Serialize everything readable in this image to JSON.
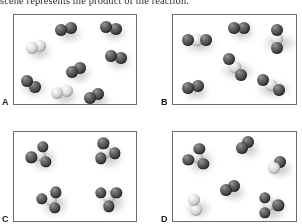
{
  "question": {
    "stem_text": "scene represents the product of the reaction."
  },
  "figure": {
    "type": "molecular-scene-multiple-choice",
    "panel_count": 4,
    "style": "space-filling-model-grayscale",
    "colors": {
      "dark_atom": "#4a4a4a",
      "light_atom": "#dcdcdc",
      "panel_border": "#6d6d6d",
      "panel_background": "#fdfdfd",
      "page_background": "#ffffff",
      "text": "#2e2e2e"
    },
    "panels": [
      {
        "id": "a",
        "label": "A",
        "description": "eight diatomic molecules: six dark-dark pairs and two light-light pairs",
        "molecules": [
          {
            "kind": "diatomic",
            "atoms": [
              "dark",
              "dark"
            ],
            "x": 52,
            "y": 14,
            "angle": -12,
            "scale": 1.0
          },
          {
            "kind": "diatomic",
            "atoms": [
              "dark",
              "dark"
            ],
            "x": 97,
            "y": 13,
            "angle": 8,
            "scale": 1.0
          },
          {
            "kind": "diatomic",
            "atoms": [
              "light",
              "light"
            ],
            "x": 22,
            "y": 32,
            "angle": -18,
            "scale": 1.0
          },
          {
            "kind": "diatomic",
            "atoms": [
              "dark",
              "dark"
            ],
            "x": 102,
            "y": 42,
            "angle": 16,
            "scale": 1.0
          },
          {
            "kind": "diatomic",
            "atoms": [
              "dark",
              "dark"
            ],
            "x": 62,
            "y": 55,
            "angle": -28,
            "scale": 1.0
          },
          {
            "kind": "diatomic",
            "atoms": [
              "dark",
              "dark"
            ],
            "x": 17,
            "y": 69,
            "angle": 35,
            "scale": 1.0
          },
          {
            "kind": "diatomic",
            "atoms": [
              "light",
              "light"
            ],
            "x": 48,
            "y": 77,
            "angle": -8,
            "scale": 1.0
          },
          {
            "kind": "diatomic",
            "atoms": [
              "dark",
              "dark"
            ],
            "x": 80,
            "y": 81,
            "angle": -20,
            "scale": 1.0
          }
        ]
      },
      {
        "id": "b",
        "label": "B",
        "description": "three dark-light-dark triatomic molecules plus three lone dark diatomic molecules",
        "molecules": [
          {
            "kind": "triatomic",
            "atoms": [
              "dark",
              "light",
              "dark"
            ],
            "x": 24,
            "y": 25,
            "angle": 0,
            "scale": 1.0
          },
          {
            "kind": "diatomic",
            "atoms": [
              "dark",
              "dark"
            ],
            "x": 66,
            "y": 13,
            "angle": -6,
            "scale": 1.0
          },
          {
            "kind": "triatomic",
            "atoms": [
              "dark",
              "light",
              "dark"
            ],
            "x": 104,
            "y": 24,
            "angle": 88,
            "scale": 1.0
          },
          {
            "kind": "triatomic",
            "atoms": [
              "dark",
              "light",
              "dark"
            ],
            "x": 62,
            "y": 52,
            "angle": 54,
            "scale": 1.0
          },
          {
            "kind": "diatomic",
            "atoms": [
              "dark",
              "dark"
            ],
            "x": 20,
            "y": 72,
            "angle": -14,
            "scale": 1.0
          },
          {
            "kind": "triatomic",
            "atoms": [
              "dark",
              "light",
              "dark"
            ],
            "x": 98,
            "y": 70,
            "angle": 34,
            "scale": 1.0
          }
        ]
      },
      {
        "id": "c",
        "label": "C",
        "description": "four pyramidal molecules, each a light central atom bonded to three dark atoms",
        "molecules": [
          {
            "kind": "pyramidal",
            "atoms": [
              "light",
              "dark",
              "dark",
              "dark"
            ],
            "x": 26,
            "y": 23,
            "angle": 18,
            "scale": 1.0
          },
          {
            "kind": "pyramidal",
            "atoms": [
              "light",
              "dark",
              "dark",
              "dark"
            ],
            "x": 92,
            "y": 20,
            "angle": -140,
            "scale": 1.0
          },
          {
            "kind": "pyramidal",
            "atoms": [
              "light",
              "dark",
              "dark",
              "dark"
            ],
            "x": 37,
            "y": 68,
            "angle": 155,
            "scale": 1.0
          },
          {
            "kind": "pyramidal",
            "atoms": [
              "light",
              "dark",
              "dark",
              "dark"
            ],
            "x": 95,
            "y": 65,
            "angle": 60,
            "scale": 1.0
          }
        ]
      },
      {
        "id": "d",
        "label": "D",
        "description": "mixture: two pyramidal molecules, two dark diatomic molecules and two light-dark diatomic molecules",
        "molecules": [
          {
            "kind": "pyramidal",
            "atoms": [
              "light",
              "dark",
              "dark",
              "dark"
            ],
            "x": 24,
            "y": 25,
            "angle": 16,
            "scale": 1.0
          },
          {
            "kind": "diatomic",
            "atoms": [
              "dark",
              "dark"
            ],
            "x": 72,
            "y": 13,
            "angle": -42,
            "scale": 1.0
          },
          {
            "kind": "diatomic",
            "atoms": [
              "light",
              "dark"
            ],
            "x": 104,
            "y": 33,
            "angle": -48,
            "scale": 1.0
          },
          {
            "kind": "diatomic",
            "atoms": [
              "dark",
              "dark"
            ],
            "x": 57,
            "y": 56,
            "angle": -22,
            "scale": 1.0
          },
          {
            "kind": "diatomic",
            "atoms": [
              "light",
              "light"
            ],
            "x": 22,
            "y": 73,
            "angle": 74,
            "scale": 1.0
          },
          {
            "kind": "pyramidal",
            "atoms": [
              "light",
              "dark",
              "dark",
              "dark"
            ],
            "x": 96,
            "y": 73,
            "angle": -30,
            "scale": 1.0
          }
        ]
      }
    ]
  }
}
